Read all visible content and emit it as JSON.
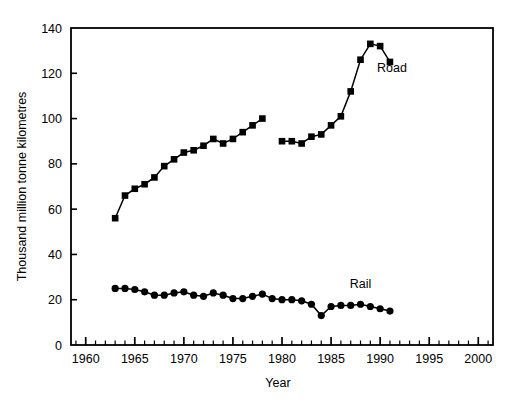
{
  "header": {
    "left_fragment": "",
    "right_fragment": ""
  },
  "chart_data": {
    "type": "line",
    "title": "",
    "xlabel": "Year",
    "ylabel": "Thousand million tonne kilometres",
    "xlim": [
      1958.5,
      2001.5
    ],
    "ylim": [
      0,
      140
    ],
    "xticks": [
      1960,
      1965,
      1970,
      1975,
      1980,
      1985,
      1990,
      1995,
      2000
    ],
    "xtick_labels": [
      "1960",
      "1965",
      "1970",
      "1975",
      "1980",
      "1985",
      "1990",
      "1995",
      "2000"
    ],
    "minor_xtick_step": 1,
    "yticks": [
      0,
      20,
      40,
      60,
      80,
      100,
      120,
      140
    ],
    "ytick_labels": [
      "0",
      "20",
      "40",
      "60",
      "80",
      "100",
      "120",
      "140"
    ],
    "grid": false,
    "legend_position": "inline-annotation",
    "line_color": "#000000",
    "series": [
      {
        "name": "Road",
        "marker": "square",
        "label": "Road",
        "label_x": 1991.2,
        "label_y": 120.5,
        "segments": [
          {
            "x": [
              1963,
              1964,
              1965,
              1966,
              1967,
              1968,
              1969,
              1970,
              1971,
              1972,
              1973,
              1974,
              1975,
              1976,
              1977,
              1978
            ],
            "y": [
              56,
              66,
              69,
              71,
              74,
              79,
              82,
              85,
              86,
              88,
              91,
              89,
              91,
              94,
              97,
              100
            ]
          },
          {
            "x": [
              1980,
              1981,
              1982,
              1983,
              1984,
              1985,
              1986,
              1987,
              1988,
              1989,
              1990,
              1991
            ],
            "y": [
              90,
              90,
              89,
              92,
              93,
              97,
              101,
              112,
              126,
              133,
              132,
              125
            ]
          }
        ]
      },
      {
        "name": "Rail",
        "marker": "circle",
        "label": "Rail",
        "label_x": 1988.0,
        "label_y": 25.0,
        "segments": [
          {
            "x": [
              1963,
              1964,
              1965,
              1966,
              1967,
              1968,
              1969,
              1970,
              1971,
              1972,
              1973,
              1974,
              1975,
              1976,
              1977,
              1978,
              1979,
              1980,
              1981,
              1982,
              1983,
              1984,
              1985,
              1986,
              1987,
              1988,
              1989,
              1990,
              1991
            ],
            "y": [
              25,
              25,
              24.5,
              23.5,
              22,
              22,
              23,
              23.5,
              22,
              21.5,
              23,
              22,
              20.5,
              20.5,
              21.5,
              22.5,
              20.5,
              20,
              20,
              19.5,
              18,
              13,
              17,
              17.5,
              17.5,
              18,
              17,
              16,
              15
            ]
          }
        ]
      }
    ]
  }
}
